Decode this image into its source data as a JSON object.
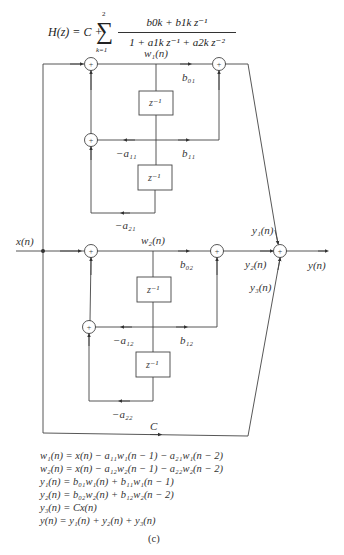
{
  "formula": {
    "lhs": "H(z) = C +",
    "sum_symbol": "∑",
    "sum_upper": "2",
    "sum_lower": "k=1",
    "numerator": "b0k + b1k z⁻¹",
    "denominator": "1 + a1k z⁻¹ + a2k z⁻²"
  },
  "signals": {
    "w1": "w₁(n)",
    "w2": "w₂(n)",
    "x": "x(n)",
    "y": "y(n)",
    "y1": "y₁(n)",
    "y2": "y₂(n)",
    "y3": "y₃(n)"
  },
  "coefficients": {
    "b01": "b₀₁",
    "b11": "b₁₁",
    "a11": "−a₁₁",
    "a21": "−a₂₁",
    "b02": "b₀₂",
    "b12": "b₁₂",
    "a12": "−a₁₂",
    "a22": "−a₂₂",
    "C": "C"
  },
  "delay_label": "z⁻¹",
  "adder_symbol": "+",
  "equations": [
    "w₁(n) = x(n) − a₁₁w₁(n − 1) − a₂₁w₁(n − 2)",
    "w₂(n) = x(n) − a₁₂w₂(n − 1) − a₂₂w₂(n − 2)",
    "y₁(n) = b₀₁w₁(n) + b₁₁w₁(n − 1)",
    "y₂(n) = b₀₂w₂(n) + b₁₂w₂(n − 2)",
    "y₃(n) = Cx(n)",
    "y(n) = y₁(n) + y₂(n) + y₃(n)"
  ],
  "caption": "(c)"
}
